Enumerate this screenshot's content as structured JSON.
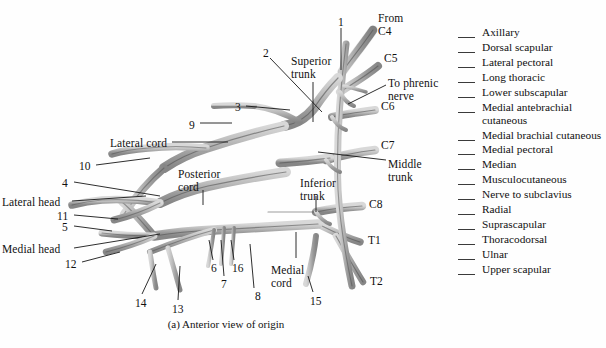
{
  "figure": {
    "caption": "(a) Anterior view of origin"
  },
  "diagram": {
    "roots": [
      {
        "id": "from-c4",
        "text": "From\nC4",
        "x": 378,
        "y": 12
      },
      {
        "id": "c5",
        "text": "C5",
        "x": 384,
        "y": 52
      },
      {
        "id": "c6",
        "text": "C6",
        "x": 381,
        "y": 100
      },
      {
        "id": "c7",
        "text": "C7",
        "x": 381,
        "y": 139
      },
      {
        "id": "c8",
        "text": "C8",
        "x": 369,
        "y": 198
      },
      {
        "id": "t1",
        "text": "T1",
        "x": 368,
        "y": 234
      },
      {
        "id": "t2",
        "text": "T2",
        "x": 370,
        "y": 275
      }
    ],
    "structures": [
      {
        "id": "superior-trunk",
        "text": "Superior\ntrunk",
        "x": 291,
        "y": 55
      },
      {
        "id": "middle-trunk",
        "text": "Middle\ntrunk",
        "x": 388,
        "y": 158
      },
      {
        "id": "inferior-trunk",
        "text": "Inferior\ntrunk",
        "x": 300,
        "y": 177
      },
      {
        "id": "to-phrenic-nerve",
        "text": "To phrenic\nnerve",
        "x": 388,
        "y": 77
      },
      {
        "id": "lateral-cord",
        "text": "Lateral cord",
        "x": 110,
        "y": 137
      },
      {
        "id": "posterior-cord",
        "text": "Posterior\ncord",
        "x": 178,
        "y": 168
      },
      {
        "id": "medial-cord",
        "text": "Medial\ncord",
        "x": 271,
        "y": 264
      },
      {
        "id": "lateral-head",
        "text": "Lateral head",
        "x": 2,
        "y": 196
      },
      {
        "id": "medial-head",
        "text": "Medial head",
        "x": 2,
        "y": 243
      }
    ],
    "numbers": [
      {
        "id": "n1",
        "text": "1",
        "x": 338,
        "y": 16
      },
      {
        "id": "n2",
        "text": "2",
        "x": 263,
        "y": 47
      },
      {
        "id": "n3",
        "text": "3",
        "x": 235,
        "y": 101
      },
      {
        "id": "n4",
        "text": "4",
        "x": 62,
        "y": 177
      },
      {
        "id": "n5",
        "text": "5",
        "x": 62,
        "y": 221
      },
      {
        "id": "n6",
        "text": "6",
        "x": 211,
        "y": 262
      },
      {
        "id": "n7",
        "text": "7",
        "x": 221,
        "y": 278
      },
      {
        "id": "n8",
        "text": "8",
        "x": 255,
        "y": 290
      },
      {
        "id": "n9",
        "text": "9",
        "x": 189,
        "y": 119
      },
      {
        "id": "n10",
        "text": "10",
        "x": 79,
        "y": 160
      },
      {
        "id": "n11",
        "text": "11",
        "x": 57,
        "y": 210
      },
      {
        "id": "n12",
        "text": "12",
        "x": 65,
        "y": 258
      },
      {
        "id": "n13",
        "text": "13",
        "x": 172,
        "y": 303
      },
      {
        "id": "n14",
        "text": "14",
        "x": 135,
        "y": 297
      },
      {
        "id": "n15",
        "text": "15",
        "x": 310,
        "y": 295
      },
      {
        "id": "n16",
        "text": "16",
        "x": 232,
        "y": 262
      }
    ]
  },
  "legend": {
    "items": [
      {
        "label": "Axillary"
      },
      {
        "label": "Dorsal scapular"
      },
      {
        "label": "Lateral pectoral"
      },
      {
        "label": "Long thoracic"
      },
      {
        "label": "Lower subscapular"
      },
      {
        "label": "Medial antebrachial\ncutaneous"
      },
      {
        "label": "Medial brachial\ncutaneous"
      },
      {
        "label": "Medial pectoral"
      },
      {
        "label": "Median"
      },
      {
        "label": "Musculocutaneous"
      },
      {
        "label": "Nerve to subclavius"
      },
      {
        "label": "Radial"
      },
      {
        "label": "Suprascapular"
      },
      {
        "label": "Thoracodorsal"
      },
      {
        "label": "Ulnar"
      },
      {
        "label": "Upper scapular"
      }
    ]
  },
  "colors": {
    "background": "#fefefe",
    "nerve_fill": "#b5b5b5",
    "nerve_fill_light": "#d4d4d4",
    "nerve_fill_dark": "#7d7d7d",
    "nerve_outline": "#4a4a4a",
    "text": "#111111",
    "leader_line": "#1a1a1a"
  }
}
